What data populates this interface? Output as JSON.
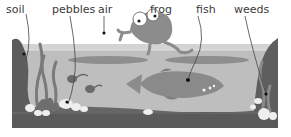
{
  "diagram": {
    "type": "labelled-illustration",
    "labels": [
      {
        "id": "soil",
        "text": "soil"
      },
      {
        "id": "pebbles",
        "text": "pebbles"
      },
      {
        "id": "air",
        "text": "air"
      },
      {
        "id": "frog",
        "text": "frog"
      },
      {
        "id": "fish",
        "text": "fish"
      },
      {
        "id": "weeds",
        "text": "weeds"
      }
    ]
  },
  "colors": {
    "water": "#bdbdbd",
    "water_surface": "#d2d2d2",
    "soil": "#555555",
    "rock": "#666666",
    "weeds": "#7a7a7a",
    "fish": "#8a8a8a",
    "frog": "#8c8c8c",
    "pebbles": "#eeeeee",
    "leader_line": "#444444",
    "text": "#3a3a3a"
  }
}
